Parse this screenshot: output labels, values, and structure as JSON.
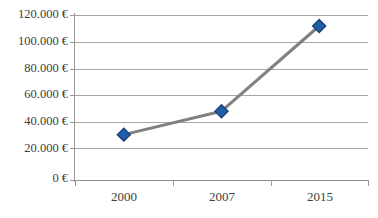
{
  "chart_data": {
    "type": "line",
    "title": "",
    "xlabel": "",
    "ylabel": "",
    "categories": [
      "2000",
      "2007",
      "2015"
    ],
    "values": [
      33000,
      50000,
      112000
    ],
    "series": [
      {
        "name": "",
        "values": [
          33000,
          50000,
          112000
        ]
      }
    ],
    "ylim": [
      0,
      120000
    ],
    "ytick_values": [
      120000,
      100000,
      80000,
      60000,
      40000,
      20000,
      0
    ],
    "ytick_labels": [
      "120.000 €",
      "100.000 €",
      "80.000 €",
      "60.000 €",
      "40.000 €",
      "20.000 €",
      "0 €"
    ],
    "xtick_labels": [
      "2000",
      "2007",
      "2015"
    ],
    "grid": true,
    "grid_axis": "y",
    "legend": false,
    "legend_position": "none",
    "currency": "€",
    "number_format": "de-DE",
    "marker": "diamond",
    "annotations": []
  },
  "style": {
    "background": "#ffffff",
    "line_color": "#808080",
    "line_width": 3,
    "marker_fill": "#1F5FA9",
    "marker_stroke": "#1B3F73",
    "marker_size": 13,
    "gridline_color": "#a6a6a6",
    "axis_color": "#9a9a9a",
    "text_color": "#404040"
  }
}
